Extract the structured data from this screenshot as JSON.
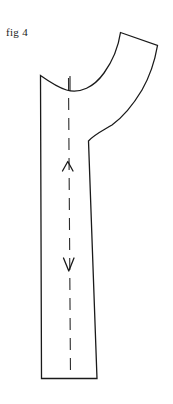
{
  "figure": {
    "label": "fig 4",
    "title": "fig 4",
    "type": "technical-line-drawing"
  },
  "colors": {
    "background": "#ffffff",
    "ink": "#1a1a1a",
    "grainline": "#2b2b2b"
  },
  "canvas": {
    "width": 173,
    "height": 404
  },
  "drawing": {
    "outline": {
      "name": "pattern-piece-outline",
      "fill": "none",
      "stroke_width": 1.3,
      "path": "M 40.5 75.5 L 41.5 378.5 L 97 378.5 L 88.5 141 C 95 134 104 130 112 125 C 123 117 133 105 142 90 C 150 76 155 60 157.5 45.5 L 120.5 32.5 C 118.5 46 113 60.5 104 73 C 94 87 80 94 66.5 90 C 58 87.5 49 81.5 40.5 75.5 Z"
    },
    "segments": [
      {
        "name": "left-edge",
        "from": [
          40.5,
          75.5
        ],
        "to": [
          41.5,
          378.5
        ],
        "style": "solid"
      },
      {
        "name": "bottom-edge",
        "from": [
          41.5,
          378.5
        ],
        "to": [
          97.0,
          378.5
        ],
        "style": "solid"
      },
      {
        "name": "right-edge",
        "from": [
          97.0,
          378.5
        ],
        "to": [
          88.5,
          141.0
        ],
        "style": "solid"
      },
      {
        "name": "inner-curve",
        "from": [
          88.5,
          141.0
        ],
        "to": [
          157.5,
          45.5
        ],
        "style": "curve"
      },
      {
        "name": "flap-top-edge",
        "from": [
          157.5,
          45.5
        ],
        "to": [
          120.5,
          32.5
        ],
        "style": "solid"
      },
      {
        "name": "outer-curve",
        "from": [
          120.5,
          32.5
        ],
        "to": [
          40.5,
          75.5
        ],
        "style": "curve"
      }
    ],
    "notch_tick": {
      "name": "notch-tick",
      "x": 70,
      "y_top": 76.5,
      "y_bottom": 90.5
    },
    "grainline": {
      "name": "grainline",
      "style": "dashed",
      "dash": 12,
      "gap": 8,
      "x_top": 68.5,
      "y_top": 78,
      "x_bottom": 70.5,
      "y_bottom": 378,
      "arrows": [
        {
          "name": "grainline-arrow-up",
          "direction": "up",
          "x": 67.5,
          "y": 162,
          "size": 10
        },
        {
          "name": "grainline-arrow-down",
          "direction": "down",
          "x": 68.5,
          "y": 263,
          "size": 10
        }
      ]
    }
  }
}
